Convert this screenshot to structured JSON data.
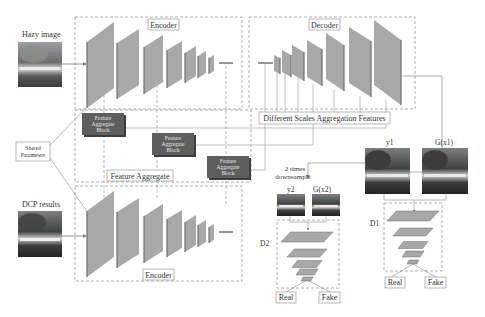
{
  "diagram": {
    "inputs": {
      "hazy_image_label": "Hazy image",
      "dcp_results_label": "DCP results"
    },
    "shared_parameters_label": [
      "Shared",
      "Parameters"
    ],
    "encoder_top_label": "Encoder",
    "encoder_bottom_label": "Encoder",
    "decoder_label": "Decoder",
    "feature_aggregate_label": "Feature Aggregate",
    "feature_aggregate_blocks": [
      {
        "lines": [
          "Feature",
          "Aggregate",
          "Block"
        ]
      },
      {
        "lines": [
          "Feature",
          "Aggregate",
          "Block"
        ]
      },
      {
        "lines": [
          "Feature",
          "Aggregate",
          "Block"
        ]
      }
    ],
    "aggregation_features_label": "Different Scales Aggregation Features",
    "downsample_label": [
      "2 times",
      "downsample"
    ],
    "outputs": {
      "y1_label": "y1",
      "g_x1_label": "G(x1)",
      "y2_label": "y2",
      "g_x2_label": "G(x2)"
    },
    "discriminators": [
      {
        "name": "D1",
        "real_label": "Real",
        "fake_label": "Fake"
      },
      {
        "name": "D2",
        "real_label": "Real",
        "fake_label": "Fake"
      }
    ],
    "colors": {
      "layer_fill": "#a8a8a8",
      "layer_edge": "#6e6e6e",
      "fab_fill": "#5e5e5e",
      "fab_shadow": "#3e3e3e",
      "dash": "#999999",
      "line": "#777777"
    }
  }
}
